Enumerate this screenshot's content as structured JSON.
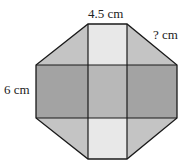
{
  "diagram": {
    "labels": {
      "top": "4.5 cm",
      "diagonal": "? cm",
      "left": "6 cm"
    },
    "colors": {
      "light": "#e6e6e6",
      "medium": "#bdbdbd",
      "dark": "#9f9f9f",
      "center": "#b4b4b4",
      "stroke": "#1a1a1a"
    }
  }
}
